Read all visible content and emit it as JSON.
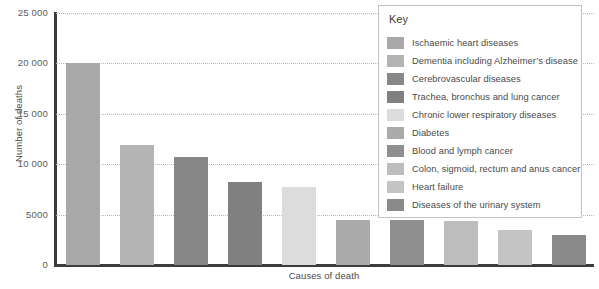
{
  "chart_data": {
    "type": "bar",
    "title": "",
    "xlabel": "Causes of death",
    "ylabel": "Number of deaths",
    "ylim": [
      0,
      25000
    ],
    "grid": true,
    "legend_position": "top-right-inset",
    "y_ticks": [
      "0",
      "5000",
      "10 000",
      "15 000",
      "20 000",
      "25 000"
    ],
    "y_tick_values": [
      0,
      5000,
      10000,
      15000,
      20000,
      25000
    ],
    "categories": [
      "Ischaemic heart diseases",
      "Dementia including Alzheimer’s disease",
      "Cerebrovascular diseases",
      "Trachea, bronchus and lung cancer",
      "Chronic lower respiratory diseases",
      "Diabetes",
      "Blood and lymph cancer",
      "Colon, sigmoid, rectum and anus cancer",
      "Heart failure",
      "Diseases of the urinary system"
    ],
    "values": [
      20000,
      11900,
      10700,
      8200,
      7700,
      4500,
      4500,
      4400,
      3500,
      3000
    ],
    "colors": [
      "#a9a9a9",
      "#b4b4b4",
      "#878787",
      "#808080",
      "#dcdcdc",
      "#ababab",
      "#8f8f8f",
      "#bdbdbd",
      "#c4c4c4",
      "#8a8a8a"
    ]
  },
  "legend": {
    "title": "Key"
  }
}
